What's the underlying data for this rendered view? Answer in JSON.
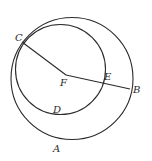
{
  "diagram": {
    "type": "geometry",
    "stroke_color": "#2a2a2a",
    "background": "#ffffff",
    "outer_circle": {
      "cx": 72,
      "cy": 78.5,
      "r": 61
    },
    "inner_circle": {
      "cx": 60.5,
      "cy": 69.5,
      "r": 45
    },
    "segments": [
      {
        "from": "C",
        "to": "F"
      },
      {
        "from": "F",
        "to": "B"
      }
    ],
    "points": {
      "C": {
        "x": 22,
        "y": 42
      },
      "F": {
        "x": 66,
        "y": 75
      },
      "E": {
        "x": 103,
        "y": 84
      },
      "B": {
        "x": 130,
        "y": 89
      }
    },
    "labels": {
      "C": "C",
      "F": "F",
      "E": "E",
      "B": "B",
      "D": "D",
      "A": "A"
    }
  }
}
